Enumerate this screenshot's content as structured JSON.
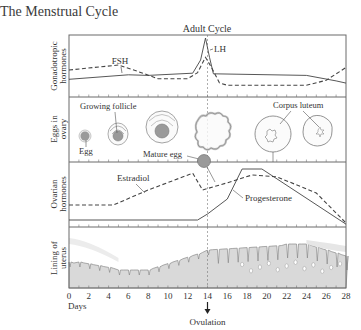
{
  "title": "The Menstrual Cycle",
  "cycle_label": "Adult Cycle",
  "panels": [
    {
      "id": "gonadotropic",
      "label_line1": "Gonadotropic",
      "label_line2": "hormones"
    },
    {
      "id": "eggs",
      "label_line1": "Eggs in",
      "label_line2": "ovary"
    },
    {
      "id": "ovarian",
      "label_line1": "Ovarian",
      "label_line2": "hormones"
    },
    {
      "id": "uterus",
      "label_line1": "Lining of",
      "label_line2": "uterus"
    }
  ],
  "labels": {
    "fsh": "FSH",
    "lh": "LH",
    "egg": "Egg",
    "growing_follicle": "Growing follicle",
    "mature_egg": "Mature egg",
    "corpus_luteum": "Corpus luteum",
    "estradiol": "Estradiol",
    "progesterone": "Progesterone"
  },
  "x_axis": {
    "label": "Days",
    "ticks": [
      "0",
      "2",
      "4",
      "6",
      "8",
      "10",
      "12",
      "14",
      "16",
      "18",
      "20",
      "22",
      "24",
      "26",
      "28"
    ],
    "event_label": "Ovulation",
    "event_day": 14
  },
  "series": {
    "fsh": [
      [
        0,
        0.45
      ],
      [
        5,
        0.55
      ],
      [
        7,
        0.42
      ],
      [
        9,
        0.28
      ],
      [
        12,
        0.28
      ],
      [
        13,
        0.4
      ],
      [
        13.8,
        0.7
      ],
      [
        14.4,
        0.5
      ],
      [
        15.2,
        0.2
      ],
      [
        16,
        0.15
      ],
      [
        24,
        0.15
      ],
      [
        26,
        0.25
      ],
      [
        28,
        0.5
      ]
    ],
    "lh": [
      [
        0,
        0.25
      ],
      [
        6,
        0.33
      ],
      [
        8,
        0.32
      ],
      [
        12.5,
        0.36
      ],
      [
        13.3,
        0.6
      ],
      [
        13.8,
        1.0
      ],
      [
        14.2,
        0.65
      ],
      [
        14.6,
        0.35
      ],
      [
        24,
        0.32
      ],
      [
        27,
        0.22
      ],
      [
        28,
        0.18
      ]
    ],
    "estradiol": [
      [
        0,
        0.35
      ],
      [
        4.5,
        0.35
      ],
      [
        8,
        0.6
      ],
      [
        12.5,
        0.88
      ],
      [
        13.5,
        0.6
      ],
      [
        16,
        0.72
      ],
      [
        18.5,
        0.85
      ],
      [
        21,
        0.82
      ],
      [
        25,
        0.55
      ],
      [
        28,
        0.05
      ]
    ],
    "progesterone": [
      [
        0,
        0.1
      ],
      [
        13,
        0.1
      ],
      [
        14,
        0.2
      ],
      [
        16,
        0.45
      ],
      [
        17.5,
        0.95
      ],
      [
        19.5,
        0.95
      ],
      [
        28,
        0.03
      ]
    ]
  },
  "colors": {
    "frame": "#6a6a6a",
    "line": "#555555",
    "lining_fill": "#d9d9d9",
    "lining_edge": "#8a8a8a",
    "egg_fill": "#9a9a9a",
    "text": "#3a3a3a"
  }
}
